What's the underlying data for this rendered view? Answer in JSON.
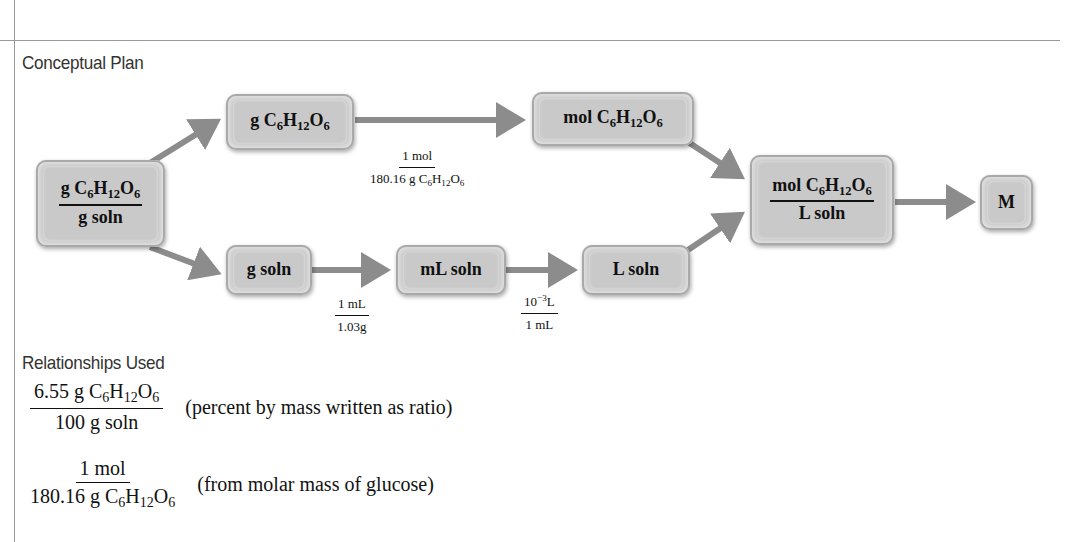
{
  "sections": {
    "conceptual_plan": "Conceptual Plan",
    "relationships_used": "Relationships Used"
  },
  "nodes": {
    "start": {
      "num_prefix": "g C",
      "num_sub1": "6",
      "num_h": "H",
      "num_sub2": "12",
      "num_o": "O",
      "num_sub3": "6",
      "den": "g soln"
    },
    "g_glucose": {
      "prefix": "g C",
      "sub1": "6",
      "h": "H",
      "sub2": "12",
      "o": "O",
      "sub3": "6"
    },
    "mol_glucose": {
      "prefix": "mol C",
      "sub1": "6",
      "h": "H",
      "sub2": "12",
      "o": "O",
      "sub3": "6"
    },
    "g_soln": {
      "label": "g soln"
    },
    "ml_soln": {
      "label": "mL soln"
    },
    "l_soln": {
      "label": "L soln"
    },
    "molarity_ratio": {
      "num_prefix": "mol C",
      "num_sub1": "6",
      "num_h": "H",
      "num_sub2": "12",
      "num_o": "O",
      "num_sub3": "6",
      "den": "L soln"
    },
    "result": {
      "label": "M"
    }
  },
  "conversion_factors": {
    "molar_mass": {
      "num": "1 mol",
      "den_prefix": "180.16 g C",
      "den_sub1": "6",
      "den_h": "H",
      "den_sub2": "12",
      "den_o": "O",
      "den_sub3": "6"
    },
    "density": {
      "num": "1 mL",
      "den": "1.03g"
    },
    "ml_to_l": {
      "num_base": "10",
      "num_exp": "−3",
      "num_unit": "L",
      "den": "1 mL"
    }
  },
  "relationships": [
    {
      "num_prefix": "6.55 g C",
      "num_sub1": "6",
      "num_h": "H",
      "num_sub2": "12",
      "num_o": "O",
      "num_sub3": "6",
      "den": "100 g soln",
      "note": "(percent by mass written as ratio)"
    },
    {
      "num": "1 mol",
      "den_prefix": "180.16 g C",
      "den_sub1": "6",
      "den_h": "H",
      "den_sub2": "12",
      "den_o": "O",
      "den_sub3": "6",
      "note": "(from molar mass of glucose)"
    }
  ],
  "colors": {
    "arrow": "#8c8c8c",
    "box_fill": "#c6c6c6",
    "rule": "#9a9a9a"
  }
}
